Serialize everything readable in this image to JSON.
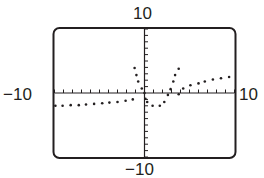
{
  "chart_data": {
    "type": "scatter",
    "title": "",
    "xlabel": "",
    "ylabel": "",
    "xlim": [
      -10,
      10
    ],
    "ylim": [
      -10,
      10
    ],
    "xscale": 1,
    "yscale": 1,
    "grid": false,
    "legend": null,
    "window_labels": {
      "ymax": "10",
      "ymin": "−10",
      "xmin": "−10",
      "xmax": "10"
    },
    "series": [
      {
        "name": "plotted points",
        "style": "dot",
        "color": "#231f20",
        "points": [
          [
            -9.9,
            -2.0
          ],
          [
            -9.1,
            -2.0
          ],
          [
            -8.2,
            -1.9
          ],
          [
            -7.3,
            -1.9
          ],
          [
            -6.5,
            -1.8
          ],
          [
            -5.6,
            -1.7
          ],
          [
            -4.7,
            -1.6
          ],
          [
            -3.9,
            -1.5
          ],
          [
            -3.0,
            -1.4
          ],
          [
            -2.1,
            -1.2
          ],
          [
            -1.3,
            -1.0
          ],
          [
            -1.1,
            3.9
          ],
          [
            -0.9,
            2.8
          ],
          [
            -0.7,
            1.8
          ],
          [
            -0.3,
            0.7
          ],
          [
            0.0,
            0.0
          ],
          [
            0.1,
            -0.9
          ],
          [
            0.3,
            -1.4
          ],
          [
            0.9,
            -2.0
          ],
          [
            1.7,
            -2.0
          ],
          [
            2.2,
            -1.4
          ],
          [
            2.6,
            -0.3
          ],
          [
            2.9,
            0.6
          ],
          [
            3.2,
            1.8
          ],
          [
            3.4,
            2.8
          ],
          [
            3.8,
            3.8
          ],
          [
            3.8,
            -0.2
          ],
          [
            4.3,
            0.7
          ],
          [
            5.1,
            1.2
          ],
          [
            6.0,
            1.5
          ],
          [
            6.7,
            1.8
          ],
          [
            7.6,
            2.1
          ],
          [
            8.5,
            2.3
          ],
          [
            9.4,
            2.5
          ]
        ]
      }
    ]
  },
  "screen": {
    "frame_color": "#231f20",
    "background": "#ffffff"
  }
}
